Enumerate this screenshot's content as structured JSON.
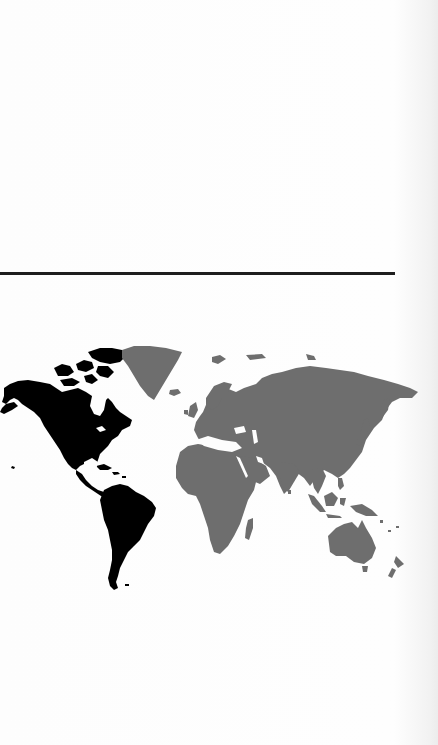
{
  "page": {
    "type": "scanned-document-page",
    "background_color": "#fbfbfb"
  },
  "ghost_text": {
    "line_1": "",
    "note": ""
  },
  "divider": {
    "color": "#1e1e1e"
  },
  "figure": {
    "type": "world-map",
    "highlight_color": "#000000",
    "other_color": "#6e6e6e",
    "regions": [
      {
        "name": "North America",
        "fill": "highlight"
      },
      {
        "name": "Central America & Caribbean",
        "fill": "highlight"
      },
      {
        "name": "South America",
        "fill": "highlight"
      },
      {
        "name": "Greenland",
        "fill": "other"
      },
      {
        "name": "Europe",
        "fill": "other"
      },
      {
        "name": "Africa",
        "fill": "other"
      },
      {
        "name": "Asia",
        "fill": "other"
      },
      {
        "name": "Australia",
        "fill": "other"
      },
      {
        "name": "New Zealand",
        "fill": "other"
      }
    ]
  }
}
